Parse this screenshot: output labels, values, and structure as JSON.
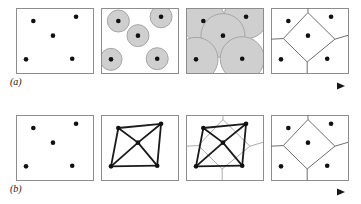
{
  "figure": {
    "width": 361,
    "height": 204,
    "background": "#ffffff"
  },
  "rows": [
    {
      "id": "row-a",
      "label": "(a)",
      "label_x": 10,
      "label_y": 77,
      "panel_top": 8,
      "panel_bottom": 73,
      "arrow": {
        "name": "progression-arrow-a",
        "x1": 44,
        "x2": 345,
        "y": 86,
        "thickness": 3.2,
        "color_start": "#d6d6d6",
        "color_end": "#161616"
      },
      "panels": [
        {
          "id": "a1",
          "name": "panel-a-sites",
          "caption": "point sites",
          "x": 16,
          "y": 8,
          "w": 77,
          "h": 65,
          "content": "points"
        },
        {
          "id": "a2",
          "name": "panel-a-small-circles",
          "caption": "small growing circles",
          "x": 101,
          "y": 8,
          "w": 77,
          "h": 65,
          "content": "circles",
          "radius": 11
        },
        {
          "id": "a3",
          "name": "panel-a-large-circles",
          "caption": "large colliding circles",
          "x": 186,
          "y": 8,
          "w": 77,
          "h": 65,
          "content": "circles",
          "radius": 22
        },
        {
          "id": "a4",
          "name": "panel-a-voronoi",
          "caption": "voronoi diagram",
          "x": 271,
          "y": 8,
          "w": 77,
          "h": 65,
          "content": "voronoi"
        }
      ]
    },
    {
      "id": "row-b",
      "label": "(b)",
      "label_x": 10,
      "label_y": 184,
      "panel_top": 115,
      "panel_bottom": 180,
      "arrow": {
        "name": "progression-arrow-b",
        "x1": 44,
        "x2": 345,
        "y": 192,
        "thickness": 3.2,
        "color_start": "#d6d6d6",
        "color_end": "#161616"
      },
      "panels": [
        {
          "id": "b1",
          "name": "panel-b-sites",
          "caption": "point sites",
          "x": 16,
          "y": 115,
          "w": 77,
          "h": 65,
          "content": "points"
        },
        {
          "id": "b2",
          "name": "panel-b-delaunay",
          "caption": "delaunay triangulation",
          "x": 101,
          "y": 115,
          "w": 77,
          "h": 65,
          "content": "delaunay"
        },
        {
          "id": "b3",
          "name": "panel-b-overlay",
          "caption": "delaunay over voronoi",
          "x": 186,
          "y": 115,
          "w": 77,
          "h": 65,
          "content": "overlay"
        },
        {
          "id": "b4",
          "name": "panel-b-voronoi",
          "caption": "voronoi diagram",
          "x": 271,
          "y": 115,
          "w": 77,
          "h": 65,
          "content": "voronoi"
        }
      ]
    }
  ],
  "sites": [
    {
      "name": "site-top-left",
      "u": 0.225,
      "v": 0.2
    },
    {
      "name": "site-top-right",
      "u": 0.78,
      "v": 0.135
    },
    {
      "name": "site-center",
      "u": 0.48,
      "v": 0.425
    },
    {
      "name": "site-bottom-left",
      "u": 0.13,
      "v": 0.79
    },
    {
      "name": "site-bottom-right",
      "u": 0.73,
      "v": 0.78
    }
  ],
  "delaunay_edges": [
    [
      0,
      1
    ],
    [
      0,
      2
    ],
    [
      1,
      2
    ],
    [
      0,
      3
    ],
    [
      2,
      3
    ],
    [
      1,
      4
    ],
    [
      2,
      4
    ],
    [
      3,
      4
    ]
  ],
  "voronoi": {
    "diamond": [
      {
        "u": 0.48,
        "v": 0.07
      },
      {
        "u": 0.83,
        "v": 0.48
      },
      {
        "u": 0.47,
        "v": 0.83
      },
      {
        "u": 0.16,
        "v": 0.47
      }
    ],
    "spokes": [
      {
        "from": 0,
        "to_u": 0.48,
        "to_v": 0.0
      },
      {
        "from": 1,
        "to_u": 1.0,
        "to_v": 0.42
      },
      {
        "from": 2,
        "to_u": 0.47,
        "to_v": 1.0
      },
      {
        "from": 3,
        "to_u": 0.0,
        "to_v": 0.48
      }
    ]
  },
  "style": {
    "panel_border": "#8d8d8d",
    "panel_fill": "#ffffff",
    "site_dot_color": "#111111",
    "site_dot_radius": 2.3,
    "circle_fill": "#cfcfcf",
    "circle_stroke": "#a6a6a6",
    "voronoi_line": "#6e6e6e",
    "delaunay_line": "#1a1a1a",
    "delaunay_width": 1.8
  }
}
